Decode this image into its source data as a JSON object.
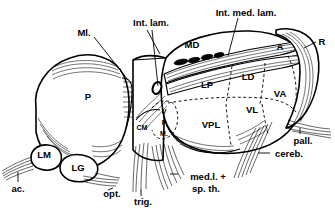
{
  "figure": {
    "background_color": "#ffffff",
    "ink_color": "#000000",
    "width": 335,
    "height": 215
  },
  "nuclei_labels": [
    {
      "id": "P",
      "text": "P",
      "x": 88,
      "y": 100,
      "size": "lbl"
    },
    {
      "id": "LM",
      "text": "LM",
      "x": 44,
      "y": 158,
      "size": "lbl"
    },
    {
      "id": "LG",
      "text": "LG",
      "x": 74,
      "y": 167,
      "size": "lbl"
    },
    {
      "id": "CM",
      "text": "CM",
      "x": 139,
      "y": 127,
      "size": "lbl-sm"
    },
    {
      "id": "MD",
      "text": "MD",
      "x": 186,
      "y": 46,
      "size": "lbl"
    },
    {
      "id": "LP",
      "text": "LP",
      "x": 203,
      "y": 85,
      "size": "lbl"
    },
    {
      "id": "LD",
      "text": "LD",
      "x": 244,
      "y": 77,
      "size": "lbl"
    },
    {
      "id": "A",
      "text": "A",
      "x": 277,
      "y": 47,
      "size": "lbl"
    },
    {
      "id": "VA",
      "text": "VA",
      "x": 275,
      "y": 95,
      "size": "lbl"
    },
    {
      "id": "VL",
      "text": "VL",
      "x": 248,
      "y": 111,
      "size": "lbl"
    },
    {
      "id": "VPL",
      "text": "VPL",
      "x": 205,
      "y": 126,
      "size": "lbl"
    },
    {
      "id": "R",
      "text": "R",
      "x": 320,
      "y": 43,
      "size": "lbl"
    }
  ],
  "vpm_stack": {
    "id": "VPM",
    "letters": [
      "V",
      "P",
      "M."
    ],
    "x": 163,
    "y_start": 113,
    "line_height": 11
  },
  "callout_labels": [
    {
      "id": "ml",
      "text": "Ml.",
      "x": 75,
      "y": 33
    },
    {
      "id": "int-lam",
      "text": "Int. lam.",
      "x": 125,
      "y": 26
    },
    {
      "id": "int-med-lam",
      "text": "Int. med. lam.",
      "x": 207,
      "y": 14
    },
    {
      "id": "pall",
      "text": "pall.",
      "x": 293,
      "y": 139
    },
    {
      "id": "cereb",
      "text": "cereb.",
      "x": 263,
      "y": 155
    },
    {
      "id": "medl-line1",
      "text": "med.l. +",
      "x": 180,
      "y": 178
    },
    {
      "id": "medl-line2",
      "text": "sp. th.",
      "x": 185,
      "y": 189
    },
    {
      "id": "trig",
      "text": "trig.",
      "x": 135,
      "y": 200
    },
    {
      "id": "opt",
      "text": "opt.",
      "x": 103,
      "y": 193
    },
    {
      "id": "ac",
      "text": "ac.",
      "x": 14,
      "y": 186
    }
  ]
}
